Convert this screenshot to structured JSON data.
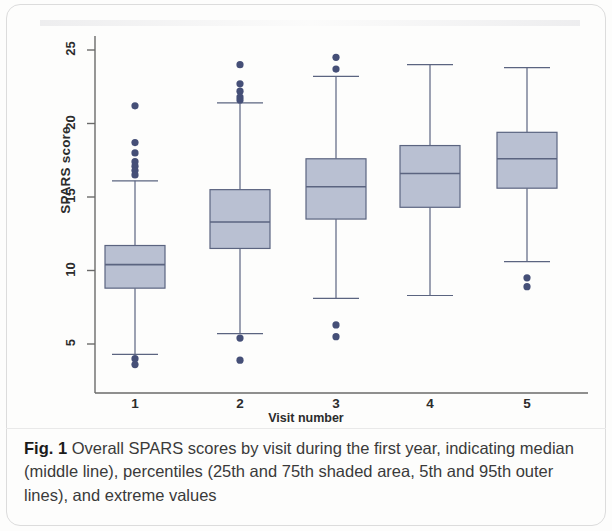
{
  "figure": {
    "caption_label": "Fig. 1",
    "caption_text": " Overall SPARS scores by visit during the first year, indicating median (middle line), percentiles (25th and 75th shaded area, 5th and 95th outer lines), and extreme values"
  },
  "colors": {
    "box_fill": "#b9c0d2",
    "box_stroke": "#5b6480",
    "line": "#5b6480",
    "outlier": "#454f77",
    "axis": "#6a6a6a",
    "text": "#2c2c2c"
  },
  "chart_data": {
    "type": "box",
    "title": "",
    "xlabel": "Visit number",
    "ylabel": "SPARS score",
    "categories": [
      "1",
      "2",
      "3",
      "4",
      "5"
    ],
    "yticks": [
      5,
      10,
      15,
      20,
      25
    ],
    "ylim": [
      3.0,
      25.8
    ],
    "grid": false,
    "legend": null,
    "boxes": [
      {
        "category": "1",
        "whisker_low": 4.3,
        "q1": 8.8,
        "median": 10.4,
        "q3": 11.7,
        "whisker_high": 16.1,
        "outliers": [
          21.2,
          18.7,
          18.0,
          17.4,
          17.1,
          16.8,
          16.5,
          4.0,
          3.6
        ]
      },
      {
        "category": "2",
        "whisker_low": 5.7,
        "q1": 11.5,
        "median": 13.3,
        "q3": 15.5,
        "whisker_high": 21.4,
        "outliers": [
          24.0,
          22.7,
          22.2,
          21.8,
          21.6,
          5.4,
          3.9
        ]
      },
      {
        "category": "3",
        "whisker_low": 8.1,
        "q1": 13.5,
        "median": 15.7,
        "q3": 17.6,
        "whisker_high": 23.2,
        "outliers": [
          24.5,
          23.7,
          6.3,
          5.5
        ]
      },
      {
        "category": "4",
        "whisker_low": 8.3,
        "q1": 14.3,
        "median": 16.6,
        "q3": 18.5,
        "whisker_high": 24.0,
        "outliers": []
      },
      {
        "category": "5",
        "whisker_low": 10.6,
        "q1": 15.6,
        "median": 17.6,
        "q3": 19.4,
        "whisker_high": 23.8,
        "outliers": [
          9.5,
          8.9
        ]
      }
    ]
  }
}
